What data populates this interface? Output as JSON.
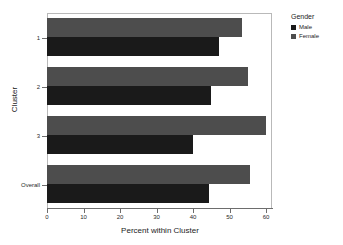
{
  "chart_data": {
    "type": "bar",
    "orientation": "horizontal",
    "title": "",
    "xlabel": "Percent within Cluster",
    "ylabel": "Cluster",
    "categories": [
      "1",
      "2",
      "3",
      "Overall"
    ],
    "series": [
      {
        "name": "Male",
        "color": "#1a1a1a",
        "values": [
          47.0,
          45.0,
          40.0,
          44.3
        ]
      },
      {
        "name": "Female",
        "color": "#4d4d4d",
        "values": [
          53.5,
          55.0,
          60.0,
          55.7
        ]
      }
    ],
    "xlim": [
      0,
      60
    ],
    "xticks": [
      0,
      10,
      20,
      30,
      40,
      50,
      60
    ],
    "xtick_labels": [
      "0",
      "10",
      "20",
      "30",
      "40",
      "50",
      "60"
    ],
    "grid": false,
    "legend": {
      "title": "Gender",
      "position": "right",
      "entries": [
        {
          "label": "Male",
          "color": "#1a1a1a"
        },
        {
          "label": "Female",
          "color": "#4d4d4d"
        }
      ]
    }
  },
  "axis": {
    "x_label": "Percent within Cluster",
    "y_label": "Cluster",
    "x_ticks": [
      "0",
      "10",
      "20",
      "30",
      "40",
      "50",
      "60"
    ],
    "y_ticks": [
      "1",
      "2",
      "3",
      "Overall"
    ]
  },
  "legend": {
    "title": "Gender",
    "male_label": "Male",
    "female_label": "Female"
  },
  "colors": {
    "male": "#1a1a1a",
    "female": "#4d4d4d",
    "frame": "#b9b9b9",
    "axis": "#6d6d6d",
    "background": "#ffffff"
  }
}
